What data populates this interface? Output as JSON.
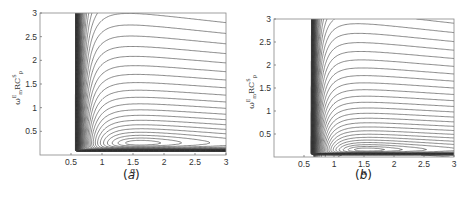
{
  "chart_data": [
    {
      "type": "contour",
      "panel_label": "(a)",
      "panel_letter": "a",
      "xlabel": "α",
      "ylabel": "ω_m^E R C_p^S",
      "ylabel_parts": {
        "base": "ω",
        "sup": "E",
        "sub": "m",
        "mid": "RC",
        "sup2": "S",
        "sub2": "p"
      },
      "xlim": [
        0,
        3
      ],
      "ylim": [
        0,
        3
      ],
      "xticks": [
        0.5,
        1,
        1.5,
        2,
        2.5,
        3
      ],
      "xtick_labels": [
        "0.5",
        "1",
        "1.5",
        "2",
        "2.5",
        "3"
      ],
      "yticks": [
        0.5,
        1,
        1.5,
        2,
        2.5,
        3
      ],
      "ytick_labels": [
        "0.5",
        "1",
        "1.5",
        "2",
        "2.5",
        "3"
      ],
      "grid": false,
      "minimum": {
        "x": 1.25,
        "y": 0.58
      },
      "wall_x": 0.5,
      "floor_y": 0.08,
      "nose_extent_x": 2.75,
      "line_color": "#3a3a3a",
      "box": {
        "left": 40,
        "top": 13,
        "right": 226,
        "bottom": 155
      }
    },
    {
      "type": "contour",
      "panel_label": "(b)",
      "panel_letter": "b",
      "xlabel": "α",
      "ylabel": "ω_m^E R C_p^S",
      "ylabel_parts": {
        "base": "ω",
        "sup": "E",
        "sub": "m",
        "mid": "RC",
        "sup2": "S",
        "sub2": "p"
      },
      "xlim": [
        0,
        3
      ],
      "ylim": [
        0,
        3
      ],
      "xticks": [
        0.5,
        1,
        1.5,
        2,
        2.5,
        3
      ],
      "xtick_labels": [
        "0.5",
        "1",
        "1.5",
        "2",
        "2.5",
        "3"
      ],
      "yticks": [
        0.5,
        1,
        1.5,
        2,
        2.5,
        3
      ],
      "ytick_labels": [
        "0.5",
        "1",
        "1.5",
        "2",
        "2.5",
        "3"
      ],
      "grid": false,
      "minimum": {
        "x": 1.05,
        "y": 0.3
      },
      "wall_x": 0.55,
      "floor_y": 0.05,
      "nose_extent_x": 2.5,
      "line_color": "#3a3a3a",
      "box": {
        "left": 274,
        "top": 19,
        "right": 454,
        "bottom": 157
      }
    }
  ]
}
